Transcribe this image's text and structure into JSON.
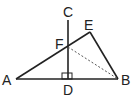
{
  "diagram": {
    "type": "geometry",
    "colors": {
      "line": "#222222",
      "background": "#ffffff"
    },
    "points": {
      "A": {
        "label": "A",
        "x": 16,
        "y": 79
      },
      "B": {
        "label": "B",
        "x": 118,
        "y": 79
      },
      "C": {
        "label": "C",
        "x": 68,
        "y": 20
      },
      "D": {
        "label": "D",
        "x": 68,
        "y": 79
      },
      "E": {
        "label": "E",
        "x": 90,
        "y": 32
      },
      "F": {
        "label": "F",
        "x": 68,
        "y": 47
      }
    },
    "segments": [
      {
        "from": "A",
        "to": "B",
        "style": "solid"
      },
      {
        "from": "A",
        "to": "E",
        "style": "solid"
      },
      {
        "from": "E",
        "to": "B",
        "style": "solid"
      },
      {
        "from": "C",
        "to": "D",
        "style": "solid"
      },
      {
        "from": "F",
        "to": "B",
        "style": "dashed"
      }
    ],
    "right_angle_marker": {
      "at": "D",
      "label": "CD ⊥ AB"
    }
  }
}
